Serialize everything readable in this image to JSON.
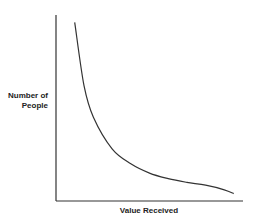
{
  "chart_data": {
    "type": "line",
    "title": "",
    "xlabel": "Value Received",
    "ylabel_line1": "Number of",
    "ylabel_line2": "People",
    "ylabel": "Number of People",
    "grid": false,
    "legend": null,
    "x_ticks": [],
    "y_ticks": [],
    "series": [
      {
        "name": "distribution",
        "color": "#333333",
        "description": "Decreasing curve (long-tail / power-law shape): steep drop at low values, flattening at high values",
        "x": [
          0.1,
          0.15,
          0.2,
          0.3,
          0.4,
          0.5,
          0.6,
          0.7,
          0.8,
          0.9,
          0.95
        ],
        "y": [
          0.96,
          0.62,
          0.45,
          0.28,
          0.2,
          0.15,
          0.12,
          0.1,
          0.085,
          0.06,
          0.04
        ]
      }
    ],
    "xlim": [
      0,
      1
    ],
    "ylim": [
      0,
      1
    ]
  }
}
